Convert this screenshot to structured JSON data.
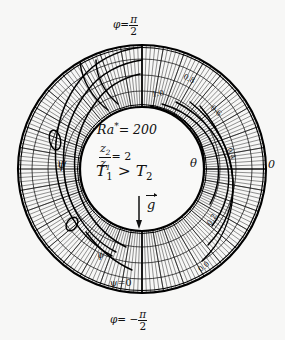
{
  "figure": {
    "kind": "annulus-streamline-isotherm-diagram",
    "background_color": "#f7f7f6",
    "ink_color": "#111111",
    "center": {
      "x": 142,
      "y": 169
    },
    "inner_radius": 62,
    "outer_radius": 124
  },
  "center_annotations": {
    "rayleigh_symbol": "Ra",
    "rayleigh_star": "*",
    "rayleigh_eq": "= 200",
    "ratio_num": "z",
    "ratio_num_sub": "2",
    "ratio_den": "z",
    "ratio_den_sub": "1",
    "ratio_eq": "= 2",
    "temp_t1": "T",
    "temp_t1_sub": "1",
    "temp_gt": ">",
    "temp_t2": "T",
    "temp_t2_sub": "2",
    "gravity_symbol": "g"
  },
  "axis_labels": {
    "top": {
      "phi": "φ",
      "eq": "=",
      "num": "π",
      "den": "2"
    },
    "bottom": {
      "phi": "φ",
      "eq": "= −",
      "num": "π",
      "den": "2"
    },
    "right_zero": "0",
    "theta_symbol": "θ",
    "psi_symbol": "ψ",
    "psi_small": "ψ",
    "psi_zero": "ψ=0"
  },
  "chart_data": {
    "type": "contour",
    "subtitle": "Ra* = 200, z2/z1 = 2, T1 > T2",
    "geometry": {
      "shape": "annulus",
      "radius_ratio": 2,
      "inner_radius_px": 62,
      "outer_radius_px": 124,
      "center_px": [
        142,
        169
      ]
    },
    "angular_axis": {
      "label": "φ",
      "ticks": [
        "π/2",
        "0",
        "-π/2"
      ],
      "tick_angles_deg": [
        90,
        0,
        -90
      ]
    },
    "series": [
      {
        "name": "isotherms",
        "symbol": "θ",
        "label_position": "right-half",
        "levels": [
          1.0,
          0.8,
          0.6,
          0.4,
          0.2,
          0.0
        ],
        "level_labels": [
          "1.0",
          "0.8",
          "0.6",
          "0.4",
          "0.2",
          "0.0"
        ]
      },
      {
        "name": "streamlines",
        "symbol": "ψ",
        "label_position": "left-half",
        "levels": [
          0.0
        ],
        "level_labels": [
          "ψ=0"
        ],
        "vortex_centers_px": [
          [
            55,
            140
          ],
          [
            72,
            224
          ]
        ]
      }
    ],
    "hatching": {
      "pattern": "dense-radial-lines",
      "region": "annulus",
      "line_count": 180
    },
    "legend_position": "none",
    "grid": true
  },
  "isotherm_labels": [
    {
      "text": "1.0"
    },
    {
      "text": "0.8"
    },
    {
      "text": "0.6"
    },
    {
      "text": "0.4"
    },
    {
      "text": "0.2"
    },
    {
      "text": "0.0"
    }
  ]
}
